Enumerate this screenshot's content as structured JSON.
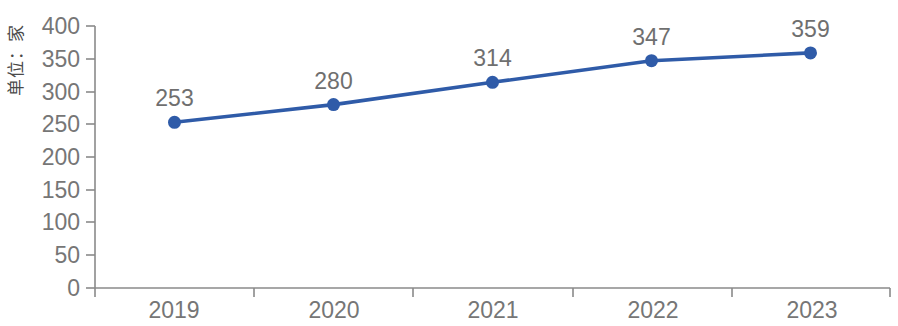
{
  "chart_data": {
    "type": "line",
    "title": "",
    "subtitle": "",
    "xlabel": "",
    "ylabel": "单位：家",
    "categories": [
      "2019",
      "2020",
      "2021",
      "2022",
      "2023"
    ],
    "values": [
      253,
      280,
      314,
      347,
      359
    ],
    "point_labels": [
      "253",
      "280",
      "314",
      "347",
      "359"
    ],
    "series": [
      {
        "name": "",
        "values": [
          253,
          280,
          314,
          347,
          359
        ],
        "color": "#2f5ba8",
        "marker": "circle",
        "show_labels": true
      }
    ],
    "ylim": [
      0,
      400
    ],
    "y_ticks": [
      0,
      50,
      100,
      150,
      200,
      250,
      300,
      350,
      400
    ],
    "y_tick_labels": [
      "0",
      "50",
      "100",
      "150",
      "200",
      "250",
      "300",
      "350",
      "400"
    ],
    "x_tick_labels": [
      "2019",
      "2020",
      "2021",
      "2022",
      "2023"
    ],
    "grid": false,
    "legend": false,
    "legend_position": "none",
    "axis_color": "#8a8a8a",
    "tick_label_color": "#767676",
    "data_label_color": "#6f6f6f"
  }
}
